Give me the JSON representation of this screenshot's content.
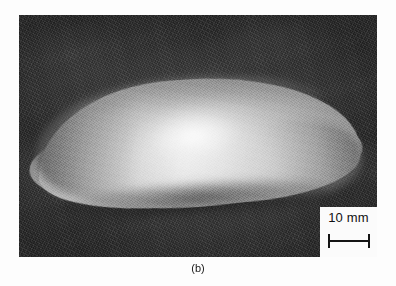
{
  "figure": {
    "caption": "(b)",
    "panel_letter": "b",
    "photo": {
      "subject": "dome-shaped-specimen",
      "background_description": "dark-grainy-背景",
      "background_color": "#343434",
      "specimen_color": "#d8d8d8",
      "specimen_shadow_color": "#5a5a5a"
    },
    "scale_inset": {
      "label": "10 mm",
      "value": 10,
      "unit": "mm",
      "bar_color": "#141414",
      "box_color": "#fbfbfb"
    }
  }
}
